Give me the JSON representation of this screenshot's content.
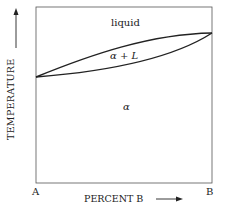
{
  "diagram": {
    "type": "binary phase diagram (isomorphous)",
    "y_axis_label": "TEMPERATURE",
    "x_axis_label": "PERCENT B",
    "x_left_label": "A",
    "x_right_label": "B",
    "regions": {
      "liquid": "liquid",
      "two_phase": "α + L",
      "solid": "α"
    },
    "line_color": "#222222"
  }
}
